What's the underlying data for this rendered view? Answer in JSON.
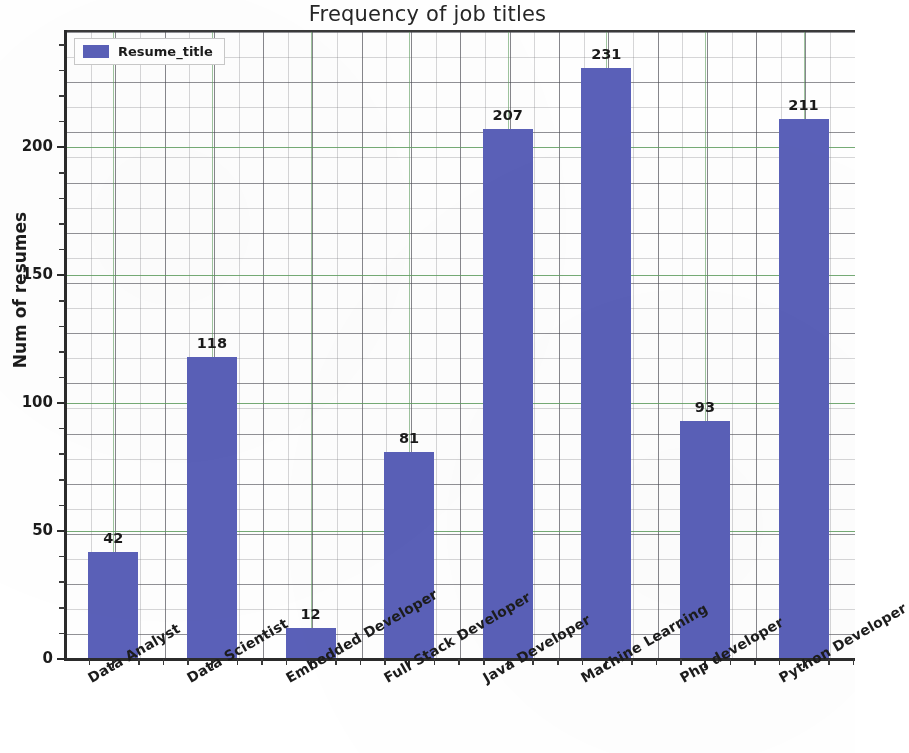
{
  "chart_data": {
    "type": "bar",
    "title": "Frequency of job titles",
    "xlabel": "",
    "ylabel": "Num of resumes",
    "categories": [
      "Data Analyst",
      "Data Scientist",
      "Embedded Developer",
      "Full Stack Developer",
      "Java Developer",
      "Machine Learning",
      "Php developer",
      "Python Developer"
    ],
    "values": [
      42,
      118,
      12,
      81,
      207,
      231,
      93,
      211
    ],
    "series": [
      {
        "name": "Resume_title",
        "values": [
          42,
          118,
          12,
          81,
          207,
          231,
          93,
          211
        ],
        "color": "#5a60b8"
      }
    ],
    "data_labels": [
      "42",
      "118",
      "12",
      "81",
      "207",
      "231",
      "93",
      "211"
    ],
    "ylim": [
      0,
      245
    ],
    "yticks": [
      0,
      50,
      100,
      150,
      200
    ],
    "ytick_labels": [
      "0",
      "50",
      "100",
      "150",
      "200"
    ],
    "grid": true,
    "grid_major_color": "#5d9c5d",
    "grid_minor_color": "#78787d",
    "legend": {
      "position": "upper left",
      "entries": [
        {
          "label": "Resume_title",
          "color": "#5a60b8"
        }
      ]
    },
    "xtick_rotation": -30,
    "bar_color": "#5a60b8",
    "background_color": "#ffffff"
  }
}
